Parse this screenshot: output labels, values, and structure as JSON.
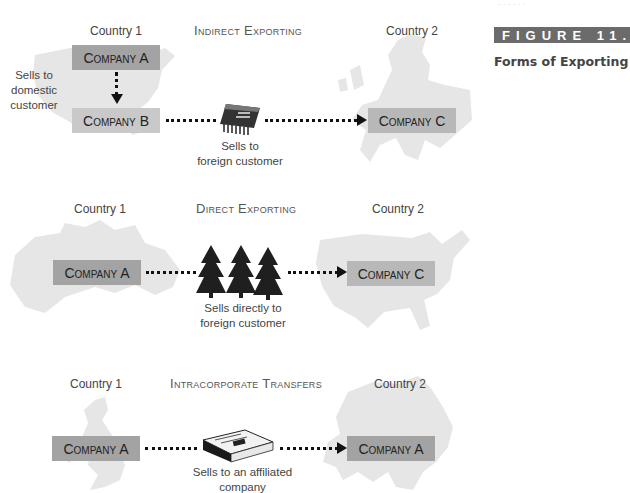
{
  "header_faint_text": "· · · · · ·",
  "figure": {
    "label": "FIGURE 11.2",
    "title": "Forms of Exporting",
    "label_bg": "#6b6b6b"
  },
  "sections": [
    {
      "title": "Indirect Exporting",
      "country1": "Country 1",
      "country2": "Country 2",
      "map1": "united-states-map",
      "map2": "europe-map",
      "companies": [
        "Company A",
        "Company B",
        "Company C"
      ],
      "domestic_caption": [
        "Sells to",
        "domestic",
        "customer"
      ],
      "icon": "microchip-icon",
      "caption": [
        "Sells to",
        "foreign customer"
      ]
    },
    {
      "title": "Direct Exporting",
      "country1": "Country 1",
      "country2": "Country 2",
      "map1": "canada-map",
      "map2": "united-states-map",
      "companies": [
        "Company A",
        "Company C"
      ],
      "icon": "pine-trees-icon",
      "caption": [
        "Sells directly to",
        "foreign customer"
      ]
    },
    {
      "title": "Intracorporate Transfers",
      "country1": "Country 1",
      "country2": "Country 2",
      "map1": "united-kingdom-map",
      "map2": "asia-map",
      "companies": [
        "Company A",
        "Company A"
      ],
      "icon": "newspaper-icon",
      "caption": [
        "Sells to an affiliated",
        "company"
      ]
    }
  ],
  "colors": {
    "box_dark": "#a3a3a3",
    "box_light": "#c9c9c9",
    "map_fill": "#e6e6e6",
    "arrow": "#111111"
  }
}
